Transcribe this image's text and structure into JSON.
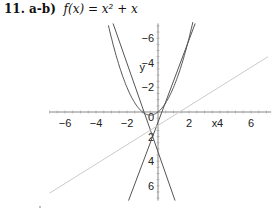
{
  "header": {
    "problem_label": "11. a-b)",
    "function_text": "f(x) = x² + x"
  },
  "chart_data": {
    "type": "line",
    "xlabel": "x",
    "ylabel": "y",
    "xlim": [
      -7,
      7
    ],
    "ylim": [
      -7,
      7
    ],
    "x_ticks": [
      -6,
      -4,
      -2,
      0,
      2,
      4,
      6
    ],
    "y_ticks": [
      -6,
      -4,
      -2,
      2,
      4,
      6
    ],
    "grid": false,
    "series": [
      {
        "name": "f(x) = x^2 + x",
        "kind": "curve",
        "color": "#555555",
        "equation": "x^2 + x",
        "vertex": [
          -0.5,
          -0.25
        ]
      },
      {
        "name": "tangent line (right)",
        "kind": "line",
        "color": "#555555",
        "points": [
          [
            -1.9,
            -7.2
          ],
          [
            2.4,
            7.2
          ]
        ]
      },
      {
        "name": "tangent line (left)",
        "kind": "line",
        "color": "#555555",
        "points": [
          [
            -2.9,
            7.2
          ],
          [
            1.1,
            -7.2
          ]
        ]
      },
      {
        "name": "secant line",
        "kind": "line",
        "color": "#cccccc",
        "points": [
          [
            -7.0,
            -6.6
          ],
          [
            7.1,
            4.5
          ]
        ]
      }
    ],
    "tick_labels_x": [
      "−6",
      "−4",
      "−2",
      "0",
      "2",
      "4",
      "6"
    ],
    "tick_labels_y": [
      "6",
      "4",
      "2",
      "−2",
      "−4",
      "−6"
    ]
  }
}
